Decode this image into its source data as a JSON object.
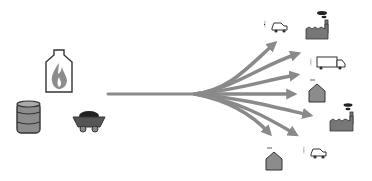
{
  "diagram": {
    "title": "",
    "colors": {
      "arrow": "#8a8a8a",
      "icon_fill": "#8c8c8c",
      "icon_stroke": "#3a3a3a",
      "background": "#ffffff"
    },
    "sources": [
      {
        "id": "gas",
        "icon": "gas-flame-tank-icon"
      },
      {
        "id": "oil",
        "icon": "oil-barrel-icon"
      },
      {
        "id": "coal",
        "icon": "coal-cart-icon"
      }
    ],
    "hub": {
      "label": ""
    },
    "consumers": [
      {
        "id": "car-1",
        "icon": "car-icon"
      },
      {
        "id": "factory-1",
        "icon": "factory-icon"
      },
      {
        "id": "truck",
        "icon": "truck-icon"
      },
      {
        "id": "house-1",
        "icon": "house-icon"
      },
      {
        "id": "factory-2",
        "icon": "factory-icon"
      },
      {
        "id": "house-2",
        "icon": "house-icon"
      },
      {
        "id": "car-2",
        "icon": "car-icon"
      }
    ]
  }
}
